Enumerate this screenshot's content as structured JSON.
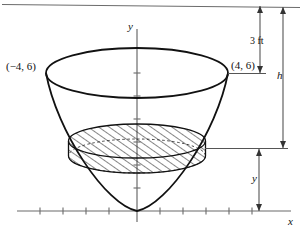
{
  "figure": {
    "kind": "paraboloid-tank-cross-section",
    "colors": {
      "ink": "#111111",
      "axis": "#6b6b6b",
      "dimension": "#555555",
      "hatch": "#222222",
      "background": "#ffffff"
    },
    "axes": {
      "x_label": "x",
      "y_label": "y",
      "x_axis_tick_count": 11,
      "y_axis_tick_count": 6
    },
    "points": [
      {
        "id": "left-rim",
        "label": "(−4, 6)",
        "x": -4,
        "y": 6
      },
      {
        "id": "right-rim",
        "label": "(4, 6)",
        "x": 4,
        "y": 6
      }
    ],
    "dimensions": [
      {
        "id": "freeboard",
        "label": "3 ft",
        "value": 3,
        "unit": "ft"
      },
      {
        "id": "total-height",
        "label": "h"
      },
      {
        "id": "slice-depth",
        "label": "y"
      }
    ],
    "curve": {
      "name": "parabola",
      "equation": "y = 3x²/8",
      "vertex": [
        0,
        0
      ]
    },
    "slice": {
      "name": "hatched-disk",
      "hatch_style": "diagonal"
    }
  }
}
